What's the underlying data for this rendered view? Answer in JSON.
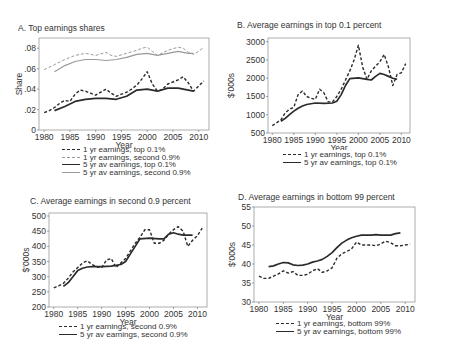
{
  "chart_data": [
    {
      "type": "line",
      "title": "A. Top earnings shares",
      "xlabel": "Year",
      "ylabel": "Share",
      "xlim": [
        1979,
        2012
      ],
      "ylim": [
        0,
        0.09
      ],
      "xticks": [
        "1980",
        "1985",
        "1990",
        "1995",
        "2000",
        "2005",
        "2010"
      ],
      "yticks": [
        "0",
        ".02",
        ".04",
        ".06",
        ".08"
      ],
      "grid": false,
      "legend_position": "below",
      "series": [
        {
          "name": "1 yr earnings, top 0.1%",
          "style": "dashed-dark",
          "x": [
            1980,
            1981,
            1982,
            1983,
            1984,
            1985,
            1986,
            1987,
            1988,
            1989,
            1990,
            1991,
            1992,
            1993,
            1994,
            1995,
            1996,
            1997,
            1998,
            1999,
            2000,
            2001,
            2002,
            2003,
            2004,
            2005,
            2006,
            2007,
            2008,
            2009,
            2010,
            2011
          ],
          "values": [
            0.017,
            0.019,
            0.022,
            0.026,
            0.029,
            0.028,
            0.035,
            0.039,
            0.038,
            0.036,
            0.034,
            0.037,
            0.04,
            0.036,
            0.033,
            0.035,
            0.037,
            0.04,
            0.044,
            0.05,
            0.057,
            0.045,
            0.038,
            0.04,
            0.045,
            0.047,
            0.049,
            0.052,
            0.046,
            0.038,
            0.043,
            0.048
          ]
        },
        {
          "name": "1 yr earnings, second 0.9%",
          "style": "dashed-light",
          "x": [
            1980,
            1982,
            1984,
            1986,
            1988,
            1990,
            1992,
            1993,
            1994,
            1996,
            1998,
            1999,
            2000,
            2001,
            2002,
            2004,
            2006,
            2007,
            2008,
            2009,
            2010,
            2011
          ],
          "values": [
            0.059,
            0.064,
            0.069,
            0.073,
            0.075,
            0.073,
            0.076,
            0.073,
            0.072,
            0.075,
            0.078,
            0.08,
            0.081,
            0.077,
            0.073,
            0.078,
            0.081,
            0.08,
            0.076,
            0.074,
            0.077,
            0.081
          ]
        },
        {
          "name": "5 yr av earnings, top 0.1%",
          "style": "solid-dark",
          "x": [
            1982,
            1984,
            1986,
            1988,
            1990,
            1992,
            1994,
            1996,
            1998,
            2000,
            2002,
            2004,
            2006,
            2008,
            2009
          ],
          "values": [
            0.019,
            0.023,
            0.028,
            0.03,
            0.031,
            0.031,
            0.03,
            0.033,
            0.039,
            0.04,
            0.038,
            0.041,
            0.041,
            0.039,
            0.038
          ]
        },
        {
          "name": "5 yr av earnings, second 0.9%",
          "style": "solid-light",
          "x": [
            1982,
            1984,
            1986,
            1988,
            1990,
            1992,
            1994,
            1996,
            1998,
            2000,
            2002,
            2004,
            2006,
            2008,
            2009
          ],
          "values": [
            0.057,
            0.063,
            0.067,
            0.069,
            0.069,
            0.068,
            0.069,
            0.071,
            0.074,
            0.075,
            0.073,
            0.075,
            0.077,
            0.075,
            0.075
          ]
        }
      ]
    },
    {
      "type": "line",
      "title": "B. Average earnings in top 0.1 percent",
      "xlabel": "Year",
      "ylabel": "$'000s",
      "xlim": [
        1979,
        2012
      ],
      "ylim": [
        500,
        3100
      ],
      "xticks": [
        "1980",
        "1985",
        "1990",
        "1995",
        "2000",
        "2005",
        "2010"
      ],
      "yticks": [
        "500",
        "1000",
        "1500",
        "2000",
        "2500",
        "3000"
      ],
      "grid": false,
      "legend_position": "below",
      "series": [
        {
          "name": "1 yr earnings, top 0.1%",
          "style": "dashed-dark",
          "x": [
            1980,
            1981,
            1982,
            1983,
            1984,
            1985,
            1986,
            1987,
            1988,
            1989,
            1990,
            1991,
            1992,
            1993,
            1994,
            1995,
            1996,
            1997,
            1998,
            1999,
            2000,
            2001,
            2002,
            2003,
            2004,
            2005,
            2006,
            2007,
            2008,
            2009,
            2010,
            2011
          ],
          "values": [
            700,
            780,
            860,
            1050,
            1150,
            1200,
            1550,
            1650,
            1500,
            1450,
            1420,
            1700,
            1600,
            1350,
            1350,
            1500,
            1700,
            1950,
            2200,
            2500,
            2900,
            2300,
            1970,
            2200,
            2330,
            2450,
            2650,
            2300,
            1800,
            2100,
            2150,
            2400
          ]
        },
        {
          "name": "5 yr av earnings, top 0.1%",
          "style": "solid-dark",
          "x": [
            1982,
            1983,
            1984,
            1985,
            1986,
            1987,
            1988,
            1990,
            1992,
            1994,
            1995,
            1996,
            1997,
            1998,
            2000,
            2002,
            2003,
            2004,
            2005,
            2006,
            2007,
            2008,
            2009
          ],
          "values": [
            820,
            900,
            1000,
            1100,
            1180,
            1240,
            1280,
            1320,
            1310,
            1320,
            1370,
            1550,
            1800,
            1990,
            2010,
            1970,
            1950,
            2050,
            2130,
            2100,
            2050,
            2000,
            1970
          ]
        }
      ]
    },
    {
      "type": "line",
      "title": "C. Average earnings in second 0.9 percent",
      "xlabel": "Year",
      "ylabel": "$'000s",
      "xlim": [
        1979,
        2012
      ],
      "ylim": [
        200,
        510
      ],
      "xticks": [
        "1980",
        "1985",
        "1990",
        "1995",
        "2000",
        "2005",
        "2010"
      ],
      "yticks": [
        "200",
        "250",
        "300",
        "350",
        "400",
        "450",
        "500"
      ],
      "grid": false,
      "legend_position": "below",
      "series": [
        {
          "name": "1 yr earnings, second 0.9%",
          "style": "dashed-dark",
          "x": [
            1980,
            1981,
            1982,
            1983,
            1984,
            1985,
            1986,
            1987,
            1988,
            1989,
            1990,
            1991,
            1992,
            1993,
            1994,
            1995,
            1996,
            1997,
            1998,
            1999,
            2000,
            2001,
            2002,
            2003,
            2004,
            2005,
            2006,
            2007,
            2008,
            2009,
            2010,
            2011
          ],
          "values": [
            263,
            270,
            278,
            295,
            315,
            330,
            345,
            352,
            340,
            332,
            330,
            355,
            360,
            330,
            345,
            360,
            385,
            410,
            430,
            455,
            455,
            410,
            410,
            420,
            440,
            455,
            465,
            450,
            400,
            420,
            435,
            460
          ]
        },
        {
          "name": "5 yr av earnings, second 0.9%",
          "style": "solid-dark",
          "x": [
            1982,
            1983,
            1984,
            1985,
            1986,
            1987,
            1988,
            1990,
            1992,
            1994,
            1995,
            1996,
            1997,
            1998,
            2000,
            2002,
            2003,
            2004,
            2005,
            2006,
            2007,
            2008,
            2009
          ],
          "values": [
            268,
            280,
            300,
            320,
            328,
            332,
            333,
            333,
            335,
            340,
            350,
            375,
            400,
            425,
            427,
            425,
            425,
            440,
            445,
            440,
            437,
            437,
            437
          ]
        }
      ]
    },
    {
      "type": "line",
      "title": "D. Average earnings in bottom 99 percent",
      "xlabel": "Year",
      "ylabel": "$'000s",
      "xlim": [
        1979,
        2012
      ],
      "ylim": [
        30,
        55
      ],
      "xticks": [
        "1980",
        "1985",
        "1990",
        "1995",
        "2000",
        "2005",
        "2010"
      ],
      "yticks": [
        "30",
        "35",
        "40",
        "45",
        "50",
        "55"
      ],
      "grid": false,
      "legend_position": "below",
      "series": [
        {
          "name": "1 yr earnings, bottom 99%",
          "style": "dashed-dark",
          "x": [
            1980,
            1981,
            1982,
            1983,
            1984,
            1985,
            1986,
            1987,
            1988,
            1989,
            1990,
            1991,
            1992,
            1993,
            1994,
            1995,
            1996,
            1997,
            1998,
            1999,
            2000,
            2001,
            2002,
            2003,
            2004,
            2005,
            2006,
            2007,
            2008,
            2009,
            2010,
            2011
          ],
          "values": [
            36.8,
            36.2,
            36.2,
            36.8,
            37.4,
            38.2,
            37.6,
            38.0,
            37.0,
            37.0,
            37.3,
            38.2,
            38.8,
            37.8,
            38.2,
            39.0,
            41.5,
            42.7,
            43.3,
            44.0,
            45.8,
            45.0,
            45.0,
            45.0,
            44.8,
            45.3,
            46.0,
            45.6,
            44.8,
            44.8,
            45.0,
            45.2
          ]
        },
        {
          "name": "5 yr av earnings, bottom 99%",
          "style": "solid-dark",
          "x": [
            1982,
            1983,
            1984,
            1985,
            1986,
            1987,
            1988,
            1989,
            1990,
            1991,
            1992,
            1993,
            1994,
            1995,
            1996,
            1997,
            1998,
            1999,
            2000,
            2001,
            2002,
            2003,
            2004,
            2005,
            2006,
            2007,
            2008,
            2009
          ],
          "values": [
            39.3,
            39.5,
            40.0,
            40.4,
            40.3,
            39.8,
            39.6,
            39.7,
            40.0,
            40.5,
            40.8,
            41.2,
            42.0,
            43.0,
            44.3,
            45.5,
            46.3,
            46.9,
            47.3,
            47.6,
            47.6,
            47.6,
            47.7,
            47.6,
            47.6,
            47.6,
            48.0,
            48.2
          ]
        }
      ]
    }
  ],
  "panels": [
    {
      "title": "A. Top earnings shares",
      "xlabel": "Year",
      "ylabel": "Share",
      "legend": [
        "1 yr earnings, top 0.1%",
        "1 yr earnings, second 0.9%",
        "5 yr av earnings, top 0.1%",
        "5 yr av earnings, second 0.9%"
      ]
    },
    {
      "title": "B. Average earnings in top 0.1 percent",
      "xlabel": "Year",
      "ylabel": "$'000s",
      "legend": [
        "1 yr earnings, top 0.1%",
        "5 yr av earnings, top 0.1%"
      ]
    },
    {
      "title": "C. Average earnings in second 0.9 percent",
      "xlabel": "Year",
      "ylabel": "$'000s",
      "legend": [
        "1 yr earnings, second 0.9%",
        "5 yr av earnings, second 0.9%"
      ]
    },
    {
      "title": "D. Average earnings in bottom 99 percent",
      "xlabel": "Year",
      "ylabel": "$'000s",
      "legend": [
        "1 yr earnings, bottom 99%",
        "5 yr av earnings, bottom 99%"
      ]
    }
  ],
  "colors": {
    "dark": "#2b2b2b",
    "light": "#9a9a9a",
    "frame": "#9a9a9a"
  }
}
